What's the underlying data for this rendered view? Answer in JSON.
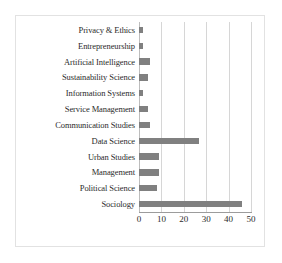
{
  "chart_data": {
    "type": "bar",
    "orientation": "horizontal",
    "title": "",
    "xlabel": "",
    "ylabel": "",
    "xlim": [
      0,
      50
    ],
    "xticks": [
      "0",
      "10",
      "20",
      "30",
      "40",
      "50"
    ],
    "grid": true,
    "legend": "none",
    "bar_color": "#808080",
    "gridline_color": "#d6d6d6",
    "categories": [
      "Privacy & Ethics",
      "Entrepreneurship",
      "Artificial Intelligence",
      "Sustainability Science",
      "Information Systems",
      "Service Management",
      "Communication Studies",
      "Data Science",
      "Urban Studies",
      "Management",
      "Political Science",
      "Sociology"
    ],
    "values": [
      2,
      2,
      5,
      4,
      2,
      4,
      5,
      27,
      9,
      9,
      8,
      46
    ]
  }
}
